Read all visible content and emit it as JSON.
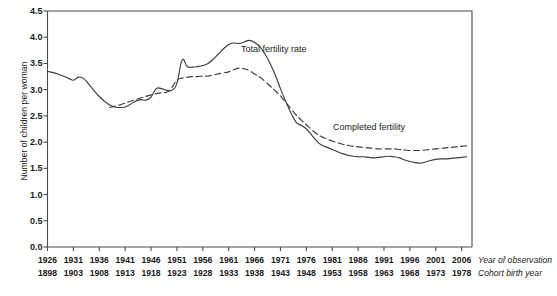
{
  "chart_data": {
    "type": "line",
    "title": "",
    "xlabel": "",
    "ylabel": "Number of children per woman",
    "ylim": [
      0.0,
      4.5
    ],
    "ytick_labels": [
      "0.0",
      "0.5",
      "1.0",
      "1.5",
      "2.0",
      "2.5",
      "3.0",
      "3.5",
      "4.0",
      "4.5"
    ],
    "ytick_values": [
      0.0,
      0.5,
      1.0,
      1.5,
      2.0,
      2.5,
      3.0,
      3.5,
      4.0,
      4.5
    ],
    "grid": false,
    "legend_position": "inline-annotation",
    "xaxis_rows": [
      {
        "caption": "Year of observation",
        "ticks": [
          "1926",
          "1931",
          "1936",
          "1941",
          "1946",
          "1951",
          "1956",
          "1961",
          "1966",
          "1971",
          "1976",
          "1981",
          "1986",
          "1991",
          "1996",
          "2001",
          "2006"
        ]
      },
      {
        "caption": "Cohort birth year",
        "ticks": [
          "1898",
          "1903",
          "1908",
          "1913",
          "1918",
          "1923",
          "1928",
          "1933",
          "1938",
          "1943",
          "1948",
          "1953",
          "1958",
          "1963",
          "1968",
          "1973",
          "1978"
        ]
      }
    ],
    "xlim": [
      1926,
      2008
    ],
    "series": [
      {
        "name": "Total fertility rate",
        "style": "solid",
        "color": "#3d3d3d",
        "x": [
          1926,
          1928,
          1930,
          1931,
          1932,
          1933,
          1934,
          1935,
          1936,
          1937,
          1938,
          1939,
          1940,
          1941,
          1942,
          1943,
          1944,
          1945,
          1946,
          1947,
          1948,
          1949,
          1950,
          1951,
          1952,
          1953,
          1954,
          1955,
          1956,
          1957,
          1958,
          1959,
          1960,
          1961,
          1962,
          1963,
          1964,
          1965,
          1966,
          1967,
          1968,
          1969,
          1970,
          1971,
          1972,
          1973,
          1974,
          1975,
          1976,
          1977,
          1978,
          1979,
          1980,
          1981,
          1982,
          1983,
          1984,
          1985,
          1986,
          1987,
          1988,
          1989,
          1990,
          1991,
          1992,
          1993,
          1994,
          1995,
          1996,
          1997,
          1998,
          1999,
          2000,
          2001,
          2002,
          2003,
          2004,
          2005,
          2006,
          2007
        ],
        "y": [
          3.35,
          3.3,
          3.22,
          3.18,
          3.24,
          3.21,
          3.1,
          2.98,
          2.87,
          2.78,
          2.71,
          2.67,
          2.66,
          2.67,
          2.72,
          2.78,
          2.81,
          2.8,
          2.86,
          3.02,
          3.02,
          2.99,
          2.99,
          3.12,
          3.56,
          3.44,
          3.43,
          3.44,
          3.46,
          3.5,
          3.58,
          3.68,
          3.78,
          3.86,
          3.89,
          3.88,
          3.91,
          3.94,
          3.9,
          3.82,
          3.68,
          3.5,
          3.28,
          3.02,
          2.78,
          2.56,
          2.38,
          2.32,
          2.25,
          2.14,
          2.02,
          1.94,
          1.9,
          1.86,
          1.82,
          1.78,
          1.75,
          1.73,
          1.72,
          1.72,
          1.71,
          1.7,
          1.71,
          1.72,
          1.73,
          1.72,
          1.7,
          1.66,
          1.63,
          1.61,
          1.6,
          1.62,
          1.65,
          1.67,
          1.68,
          1.68,
          1.69,
          1.7,
          1.71,
          1.72
        ]
      },
      {
        "name": "Completed fertility",
        "style": "dashed",
        "color": "#3d3d3d",
        "x": [
          1938,
          1940,
          1942,
          1944,
          1946,
          1948,
          1949,
          1950,
          1951,
          1952,
          1953,
          1954,
          1955,
          1956,
          1957,
          1958,
          1959,
          1960,
          1961,
          1962,
          1963,
          1964,
          1965,
          1966,
          1967,
          1968,
          1969,
          1970,
          1971,
          1972,
          1973,
          1974,
          1975,
          1976,
          1977,
          1978,
          1979,
          1980,
          1981,
          1982,
          1983,
          1984,
          1985,
          1986,
          1987,
          1988,
          1989,
          1990,
          1991,
          1992,
          1993,
          1994,
          1995,
          1996,
          1997,
          1998,
          1999,
          2000,
          2001,
          2002,
          2003,
          2004,
          2005,
          2006,
          2007
        ],
        "y": [
          2.66,
          2.71,
          2.78,
          2.84,
          2.9,
          2.94,
          2.95,
          3.04,
          3.18,
          3.22,
          3.24,
          3.25,
          3.25,
          3.26,
          3.26,
          3.28,
          3.3,
          3.32,
          3.34,
          3.38,
          3.41,
          3.4,
          3.36,
          3.3,
          3.24,
          3.16,
          3.07,
          2.98,
          2.88,
          2.76,
          2.64,
          2.52,
          2.42,
          2.33,
          2.24,
          2.16,
          2.1,
          2.06,
          2.02,
          1.99,
          1.96,
          1.94,
          1.92,
          1.91,
          1.9,
          1.89,
          1.88,
          1.87,
          1.87,
          1.87,
          1.87,
          1.86,
          1.85,
          1.84,
          1.84,
          1.84,
          1.85,
          1.86,
          1.87,
          1.88,
          1.89,
          1.9,
          1.91,
          1.92,
          1.93
        ]
      }
    ],
    "annotations": [
      {
        "text": "Total fertility rate",
        "x_px": 241,
        "y_px": 44
      },
      {
        "text": "Completed fertility",
        "x_px": 333,
        "y_px": 122
      }
    ]
  }
}
